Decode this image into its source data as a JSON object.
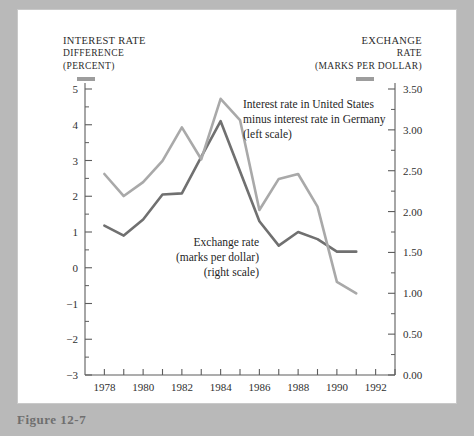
{
  "figure": {
    "caption": "Figure 12-7"
  },
  "left_axis": {
    "title_line1": "INTEREST RATE",
    "title_line2": "DIFFERENCE",
    "title_line3": "(PERCENT)",
    "ticks": [
      "5",
      "4",
      "3",
      "2",
      "1",
      "0",
      "−1",
      "−2",
      "−3"
    ]
  },
  "right_axis": {
    "title_line1": "EXCHANGE",
    "title_line2": "RATE",
    "title_line3": "(MARKS PER DOLLAR)",
    "ticks": [
      "3.50",
      "3.00",
      "2.50",
      "2.00",
      "1.50",
      "1.00",
      "0.50",
      "0.00"
    ]
  },
  "x_axis": {
    "ticks": [
      "1978",
      "1980",
      "1982",
      "1984",
      "1986",
      "1988",
      "1990",
      "1992"
    ]
  },
  "annotations": {
    "interest": {
      "line1": "Interest rate in United States",
      "line2": "minus interest rate in Germany",
      "line3": "(left scale)"
    },
    "exchange": {
      "line1": "Exchange rate",
      "line2": "(marks per dollar)",
      "line3": "(right scale)"
    }
  },
  "colors": {
    "interest_line": "#707070",
    "exchange_line": "#a9a9a9",
    "axis": "#5d5d5d",
    "page_background": "#b9b9b9",
    "plot_background": "#ffffff"
  },
  "chart_data": {
    "type": "line",
    "title": "",
    "xlabel": "",
    "ylabel": "Interest rate difference (percent)",
    "y2label": "Exchange rate (marks per dollar)",
    "xlim": [
      1977,
      1993
    ],
    "ylim": [
      -3,
      5
    ],
    "y2lim": [
      0.0,
      3.5
    ],
    "grid": false,
    "legend": "annotations-inline",
    "x": [
      1978,
      1979,
      1980,
      1981,
      1982,
      1983,
      1984,
      1985,
      1986,
      1987,
      1988,
      1989,
      1990,
      1991
    ],
    "series": [
      {
        "name": "Interest rate in United States minus interest rate in Germany (left scale)",
        "axis": "left",
        "units": "percent",
        "color": "#707070",
        "values": [
          1.18,
          0.9,
          1.35,
          2.05,
          2.08,
          3.1,
          4.1,
          2.7,
          1.3,
          0.62,
          1.0,
          0.8,
          0.45,
          0.45
        ]
      },
      {
        "name": "Exchange rate (marks per dollar) (right scale)",
        "axis": "right",
        "units": "marks per dollar",
        "color": "#a9a9a9",
        "values": [
          2.46,
          2.19,
          2.36,
          2.62,
          3.03,
          2.64,
          3.38,
          3.12,
          2.02,
          2.4,
          2.46,
          2.06,
          1.14,
          1.0
        ]
      }
    ]
  }
}
